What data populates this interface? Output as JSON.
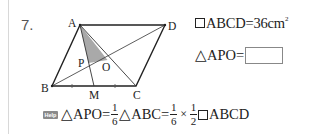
{
  "problem": {
    "number": "7.",
    "figure": {
      "points": {
        "A": "A",
        "B": "B",
        "C": "C",
        "D": "D",
        "M": "M",
        "P": "P",
        "O": "O"
      },
      "shaded_region": "triangle APO",
      "shade_color": "#a9a9a9"
    },
    "given": {
      "shape_symbol": "parallelogram-icon",
      "text": "ABCD=36",
      "unit": "cm",
      "exponent": "2"
    },
    "question": {
      "symbol": "triangle-icon",
      "text": "APO=",
      "answer": ""
    },
    "help": {
      "badge": "Help",
      "parts": [
        {
          "type": "text",
          "value": "△APO="
        },
        {
          "type": "frac",
          "num": "1",
          "den": "6"
        },
        {
          "type": "text",
          "value": "△ABC="
        },
        {
          "type": "frac",
          "num": "1",
          "den": "6"
        },
        {
          "type": "text",
          "value": "×"
        },
        {
          "type": "frac",
          "num": "1",
          "den": "2"
        },
        {
          "type": "text",
          "value": "ABCD"
        }
      ],
      "t1": "△APO=",
      "f1_num": "1",
      "f1_den": "6",
      "t2": "△ABC=",
      "f2_num": "1",
      "f2_den": "6",
      "t3": "×",
      "f3_num": "1",
      "f3_den": "2",
      "t4": "ABCD"
    }
  }
}
